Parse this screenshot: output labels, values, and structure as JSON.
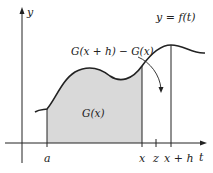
{
  "diagram": {
    "axes": {
      "vertical_label": "y",
      "horizontal_label": "t"
    },
    "curve_label": "y = f(t)",
    "region_labels": {
      "shaded_area": "G(x)",
      "difference": "G(x + h) − G(x)"
    },
    "tick_labels": {
      "a": "a",
      "x": "x",
      "z": "z",
      "x_plus_h": "x + h"
    },
    "colors": {
      "stroke": "#222222",
      "shade": "#d9d9d9",
      "background": "#ffffff"
    }
  }
}
